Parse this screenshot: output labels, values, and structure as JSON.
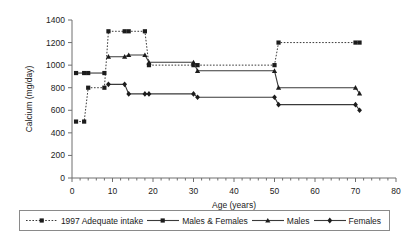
{
  "chart_data": {
    "type": "line",
    "title": "",
    "xlabel": "Age (years)",
    "ylabel": "Calcium (mg/day)",
    "xlim": [
      0,
      80
    ],
    "ylim": [
      0,
      1400
    ],
    "xticks": [
      0,
      10,
      20,
      30,
      40,
      50,
      60,
      70,
      80
    ],
    "yticks": [
      0,
      200,
      400,
      600,
      800,
      1000,
      1200,
      1400
    ],
    "xtick_labels": [
      "0",
      "10",
      "20",
      "30",
      "40",
      "50",
      "60",
      "70",
      "80"
    ],
    "ytick_labels": [
      "0",
      "200",
      "400",
      "600",
      "800",
      "1000",
      "1200",
      "1400"
    ],
    "grid": false,
    "legend_position": "below",
    "minor_ticks_x": true,
    "series": [
      {
        "name": "1997 Adequate intake",
        "style": "dotted",
        "marker": "square",
        "points": [
          {
            "x": 1,
            "y": 500
          },
          {
            "x": 3,
            "y": 500
          },
          {
            "x": 4,
            "y": 800
          },
          {
            "x": 8,
            "y": 800
          },
          {
            "x": 9,
            "y": 1300
          },
          {
            "x": 13,
            "y": 1300
          },
          {
            "x": 14,
            "y": 1300
          },
          {
            "x": 18,
            "y": 1300
          },
          {
            "x": 19,
            "y": 1000
          },
          {
            "x": 30,
            "y": 1000
          },
          {
            "x": 31,
            "y": 1000
          },
          {
            "x": 50,
            "y": 1000
          },
          {
            "x": 51,
            "y": 1200
          },
          {
            "x": 70,
            "y": 1200
          },
          {
            "x": 71,
            "y": 1200
          }
        ]
      },
      {
        "name": "Males & Females",
        "style": "solid",
        "marker": "square",
        "points": [
          {
            "x": 1,
            "y": 930
          },
          {
            "x": 3,
            "y": 930
          },
          {
            "x": 4,
            "y": 930
          },
          {
            "x": 8,
            "y": 930
          }
        ]
      },
      {
        "name": "Males",
        "style": "solid",
        "marker": "triangle",
        "points": [
          {
            "x": 9,
            "y": 1075
          },
          {
            "x": 13,
            "y": 1075
          },
          {
            "x": 14,
            "y": 1090
          },
          {
            "x": 18,
            "y": 1090
          },
          {
            "x": 19,
            "y": 1025
          },
          {
            "x": 30,
            "y": 1025
          },
          {
            "x": 31,
            "y": 950
          },
          {
            "x": 50,
            "y": 950
          },
          {
            "x": 51,
            "y": 800
          },
          {
            "x": 70,
            "y": 800
          },
          {
            "x": 71,
            "y": 750
          }
        ]
      },
      {
        "name": "Females",
        "style": "solid",
        "marker": "diamond",
        "points": [
          {
            "x": 9,
            "y": 830
          },
          {
            "x": 13,
            "y": 830
          },
          {
            "x": 14,
            "y": 745
          },
          {
            "x": 18,
            "y": 745
          },
          {
            "x": 19,
            "y": 745
          },
          {
            "x": 30,
            "y": 745
          },
          {
            "x": 31,
            "y": 715
          },
          {
            "x": 50,
            "y": 715
          },
          {
            "x": 51,
            "y": 650
          },
          {
            "x": 70,
            "y": 650
          },
          {
            "x": 71,
            "y": 600
          }
        ]
      }
    ]
  },
  "legend": {
    "items": [
      {
        "label": "1997 Adequate intake",
        "style": "dotted",
        "marker": "square"
      },
      {
        "label": "Males & Females",
        "style": "solid",
        "marker": "square"
      },
      {
        "label": "Males",
        "style": "solid",
        "marker": "triangle"
      },
      {
        "label": "Females",
        "style": "solid",
        "marker": "diamond"
      }
    ]
  },
  "colors": {
    "line": "#3a3a3a",
    "marker": "#1c1c1c",
    "axis": "#6f6f6f",
    "text": "#222222",
    "background": "#ffffff"
  }
}
